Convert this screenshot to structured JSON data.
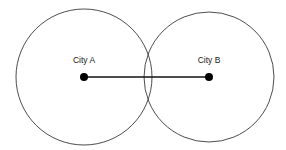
{
  "diagram": {
    "type": "venn-two-circles",
    "background_color": "#ffffff",
    "width": 286,
    "height": 150,
    "circle_stroke_color": "#4d4d4d",
    "line_color": "#111111",
    "dot_color": "#000000",
    "label_color": "#1a1a1a",
    "nodes": [
      {
        "id": "city-a",
        "label": "City A",
        "cx": 84,
        "cy": 77,
        "radius": 68,
        "dot_radius": 4,
        "label_x": 84,
        "label_y": 63
      },
      {
        "id": "city-b",
        "label": "City B",
        "cx": 209,
        "cy": 77,
        "radius": 65,
        "dot_radius": 4,
        "label_x": 209,
        "label_y": 63
      }
    ],
    "connector": {
      "id": "a-to-b-line",
      "x1": 84,
      "y1": 77,
      "x2": 209,
      "y2": 77
    }
  }
}
